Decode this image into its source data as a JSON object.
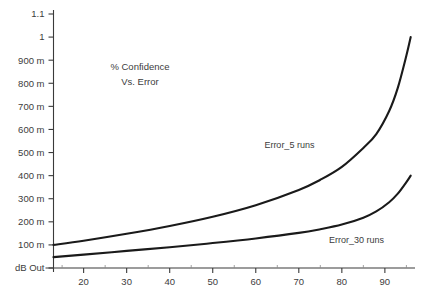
{
  "chart_data": {
    "type": "line",
    "title_lines": [
      "% Confidence",
      "Vs. Error"
    ],
    "xlabel": "",
    "ylabel": "dB Out",
    "xlim": [
      13,
      97
    ],
    "ylim": [
      0,
      1.1
    ],
    "grid": false,
    "legend_position": "inline-annotations",
    "x_tick_labels": [
      "20",
      "30",
      "40",
      "50",
      "60",
      "70",
      "80",
      "90"
    ],
    "x_ticks": [
      20,
      30,
      40,
      50,
      60,
      70,
      80,
      90
    ],
    "y_tick_labels": [
      "1.1",
      "1",
      "900 m",
      "800 m",
      "700 m",
      "600 m",
      "500 m",
      "400 m",
      "300 m",
      "200 m",
      "100 m",
      "dB Out"
    ],
    "y_ticks": [
      1.1,
      1.0,
      0.9,
      0.8,
      0.7,
      0.6,
      0.5,
      0.4,
      0.3,
      0.2,
      0.1,
      0.0
    ],
    "series": [
      {
        "name": "Error_5 runs",
        "label": "Error_5 runs",
        "label_x": 62,
        "label_y": 0.52,
        "x": [
          13,
          20,
          30,
          40,
          50,
          60,
          70,
          75,
          80,
          85,
          88,
          91,
          93,
          95,
          96
        ],
        "values": [
          0.1,
          0.118,
          0.148,
          0.182,
          0.222,
          0.272,
          0.338,
          0.382,
          0.438,
          0.52,
          0.58,
          0.68,
          0.78,
          0.92,
          1.0
        ]
      },
      {
        "name": "Error_30 runs",
        "label": "Error_30 runs",
        "label_x": 77,
        "label_y": 0.108,
        "x": [
          13,
          20,
          30,
          40,
          50,
          60,
          70,
          75,
          80,
          85,
          88,
          91,
          93,
          95,
          96
        ],
        "values": [
          0.047,
          0.058,
          0.074,
          0.09,
          0.108,
          0.128,
          0.152,
          0.168,
          0.188,
          0.218,
          0.245,
          0.285,
          0.322,
          0.372,
          0.4
        ]
      }
    ]
  }
}
